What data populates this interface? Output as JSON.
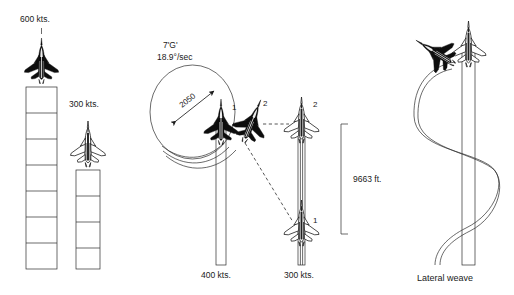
{
  "figure": {
    "background_color": "#ffffff",
    "line_color": "#2b2b2b",
    "dark_aircraft_color": "#0d0d0d",
    "light_aircraft_color": "#ffffff"
  },
  "panels": {
    "left": {
      "name": "speed-comparison-panel",
      "tracks": [
        {
          "label": "600 kts.",
          "speed_value": 600,
          "units": "kts.",
          "aircraft_style": "filled",
          "rungs": 6
        },
        {
          "label": "300 kts.",
          "speed_value": 300,
          "units": "kts.",
          "aircraft_style": "outline",
          "rungs": 3
        }
      ]
    },
    "center": {
      "name": "turn-performance-panel",
      "g_load_label": "7'G'",
      "turn_rate_label": "18.9°/sec",
      "turn_diameter_label": "2050",
      "separation_label": "9663 ft.",
      "speed_label_left": "400 kts.",
      "speed_label_right": "300 kts.",
      "aircraft_markers": [
        "1",
        "2"
      ]
    },
    "right": {
      "name": "lateral-weave-panel",
      "caption": "Lateral weave"
    }
  },
  "icons": {
    "fighter_jet_dark": "fighter-jet-dark-icon",
    "fighter_jet_light": "fighter-jet-light-icon",
    "double_arrow": "double-headed-arrow-icon",
    "bracket": "dimension-bracket-icon"
  }
}
